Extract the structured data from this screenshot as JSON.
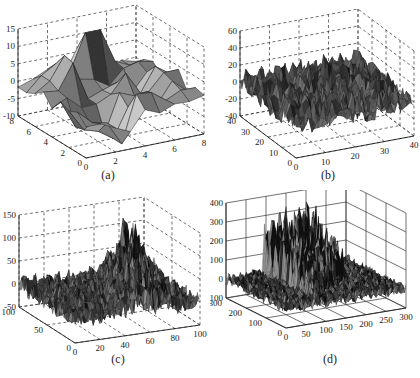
{
  "chart_data": [
    {
      "type": "surface",
      "panel": "a",
      "caption": "(a)",
      "grid_style": "dashed",
      "x_ticks": [
        "0",
        "2",
        "4",
        "6",
        "8"
      ],
      "y_ticks": [
        "0",
        "2",
        "4",
        "6",
        "8"
      ],
      "z_ticks": [
        "-10",
        "-5",
        "0",
        "5",
        "10",
        "15"
      ],
      "xlim": [
        0,
        8
      ],
      "ylim": [
        0,
        8
      ],
      "zlim": [
        -10,
        15
      ],
      "description": "Coarse 8x8 faceted surface with values mostly between -10 and 12; peak ~12 near back-center, deep troughs ~-10 near front-center"
    },
    {
      "type": "surface",
      "panel": "b",
      "caption": "(b)",
      "grid_style": "dashed",
      "x_ticks": [
        "0",
        "10",
        "20",
        "30",
        "40"
      ],
      "y_ticks": [
        "0",
        "10",
        "20",
        "30",
        "40"
      ],
      "z_ticks": [
        "-40",
        "-20",
        "0",
        "20",
        "40",
        "60"
      ],
      "xlim": [
        0,
        40
      ],
      "ylim": [
        0,
        40
      ],
      "zlim": [
        -40,
        60
      ],
      "description": "Noisy 40x40 surface fluctuating around 0 (-40 to 20) with central peak reaching ~45"
    },
    {
      "type": "surface",
      "panel": "c",
      "caption": "(c)",
      "grid_style": "dashed",
      "x_ticks": [
        "0",
        "20",
        "40",
        "60",
        "80",
        "100"
      ],
      "y_ticks": [
        "0",
        "50",
        "100"
      ],
      "z_ticks": [
        "-50",
        "0",
        "50",
        "100",
        "150"
      ],
      "xlim": [
        0,
        100
      ],
      "ylim": [
        0,
        100
      ],
      "zlim": [
        -50,
        150
      ],
      "description": "Dense 100x100 noisy surface around 0 with a diagonal ridge of spikes rising to ~120"
    },
    {
      "type": "surface",
      "panel": "d",
      "caption": "(d)",
      "grid_style": "solid",
      "x_ticks": [
        "0",
        "50",
        "100",
        "150",
        "200",
        "250",
        "300"
      ],
      "y_ticks": [
        "0",
        "100",
        "200",
        "300"
      ],
      "z_ticks": [
        "-100",
        "0",
        "100",
        "200",
        "300",
        "400"
      ],
      "xlim": [
        0,
        300
      ],
      "ylim": [
        0,
        300
      ],
      "zlim": [
        -100,
        400
      ],
      "description": "Very dense 300x300 noisy surface near 0 with a diagonal wedge of spikes rising toward ~300 at the back"
    }
  ],
  "captions": {
    "a": "(a)",
    "b": "(b)",
    "c": "(c)",
    "d": "(d)"
  }
}
